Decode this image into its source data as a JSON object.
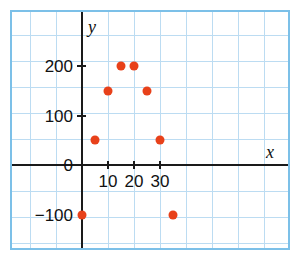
{
  "chart_data": {
    "type": "scatter",
    "title": "",
    "subtitle": "",
    "xlabel": "x",
    "ylabel": "y",
    "xlim": [
      -3,
      38
    ],
    "ylim": [
      -150,
      255
    ],
    "grid": true,
    "legend": "none",
    "x_ticks": [
      10,
      20,
      30
    ],
    "x_tick_labels": [
      "10",
      "20",
      "30"
    ],
    "y_ticks": [
      -100,
      0,
      100,
      200
    ],
    "y_tick_labels": [
      "−100",
      "0",
      "100",
      "200"
    ],
    "point_color": "#e8411a",
    "grid_color": "#bcdcf2",
    "frame_color": "#7cc0e8",
    "axis_color": "#1a1a1a",
    "x": [
      0,
      5,
      10,
      15,
      20,
      25,
      30,
      35
    ],
    "y": [
      -100,
      50,
      150,
      200,
      200,
      150,
      50,
      -100
    ],
    "points": [
      {
        "x": 0,
        "y": -100
      },
      {
        "x": 5,
        "y": 50
      },
      {
        "x": 10,
        "y": 150
      },
      {
        "x": 15,
        "y": 200
      },
      {
        "x": 20,
        "y": 200
      },
      {
        "x": 25,
        "y": 150
      },
      {
        "x": 30,
        "y": 50
      },
      {
        "x": 35,
        "y": -100
      }
    ]
  },
  "axis_labels": {
    "x": "x",
    "y": "y"
  }
}
